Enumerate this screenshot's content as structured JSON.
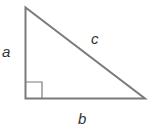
{
  "diagram": {
    "type": "right-triangle",
    "labels": {
      "side_a": "a",
      "side_b": "b",
      "side_c": "c"
    },
    "stroke_color": "#7a7a7a",
    "label_color": "#333333",
    "right_angle_marker": true
  }
}
